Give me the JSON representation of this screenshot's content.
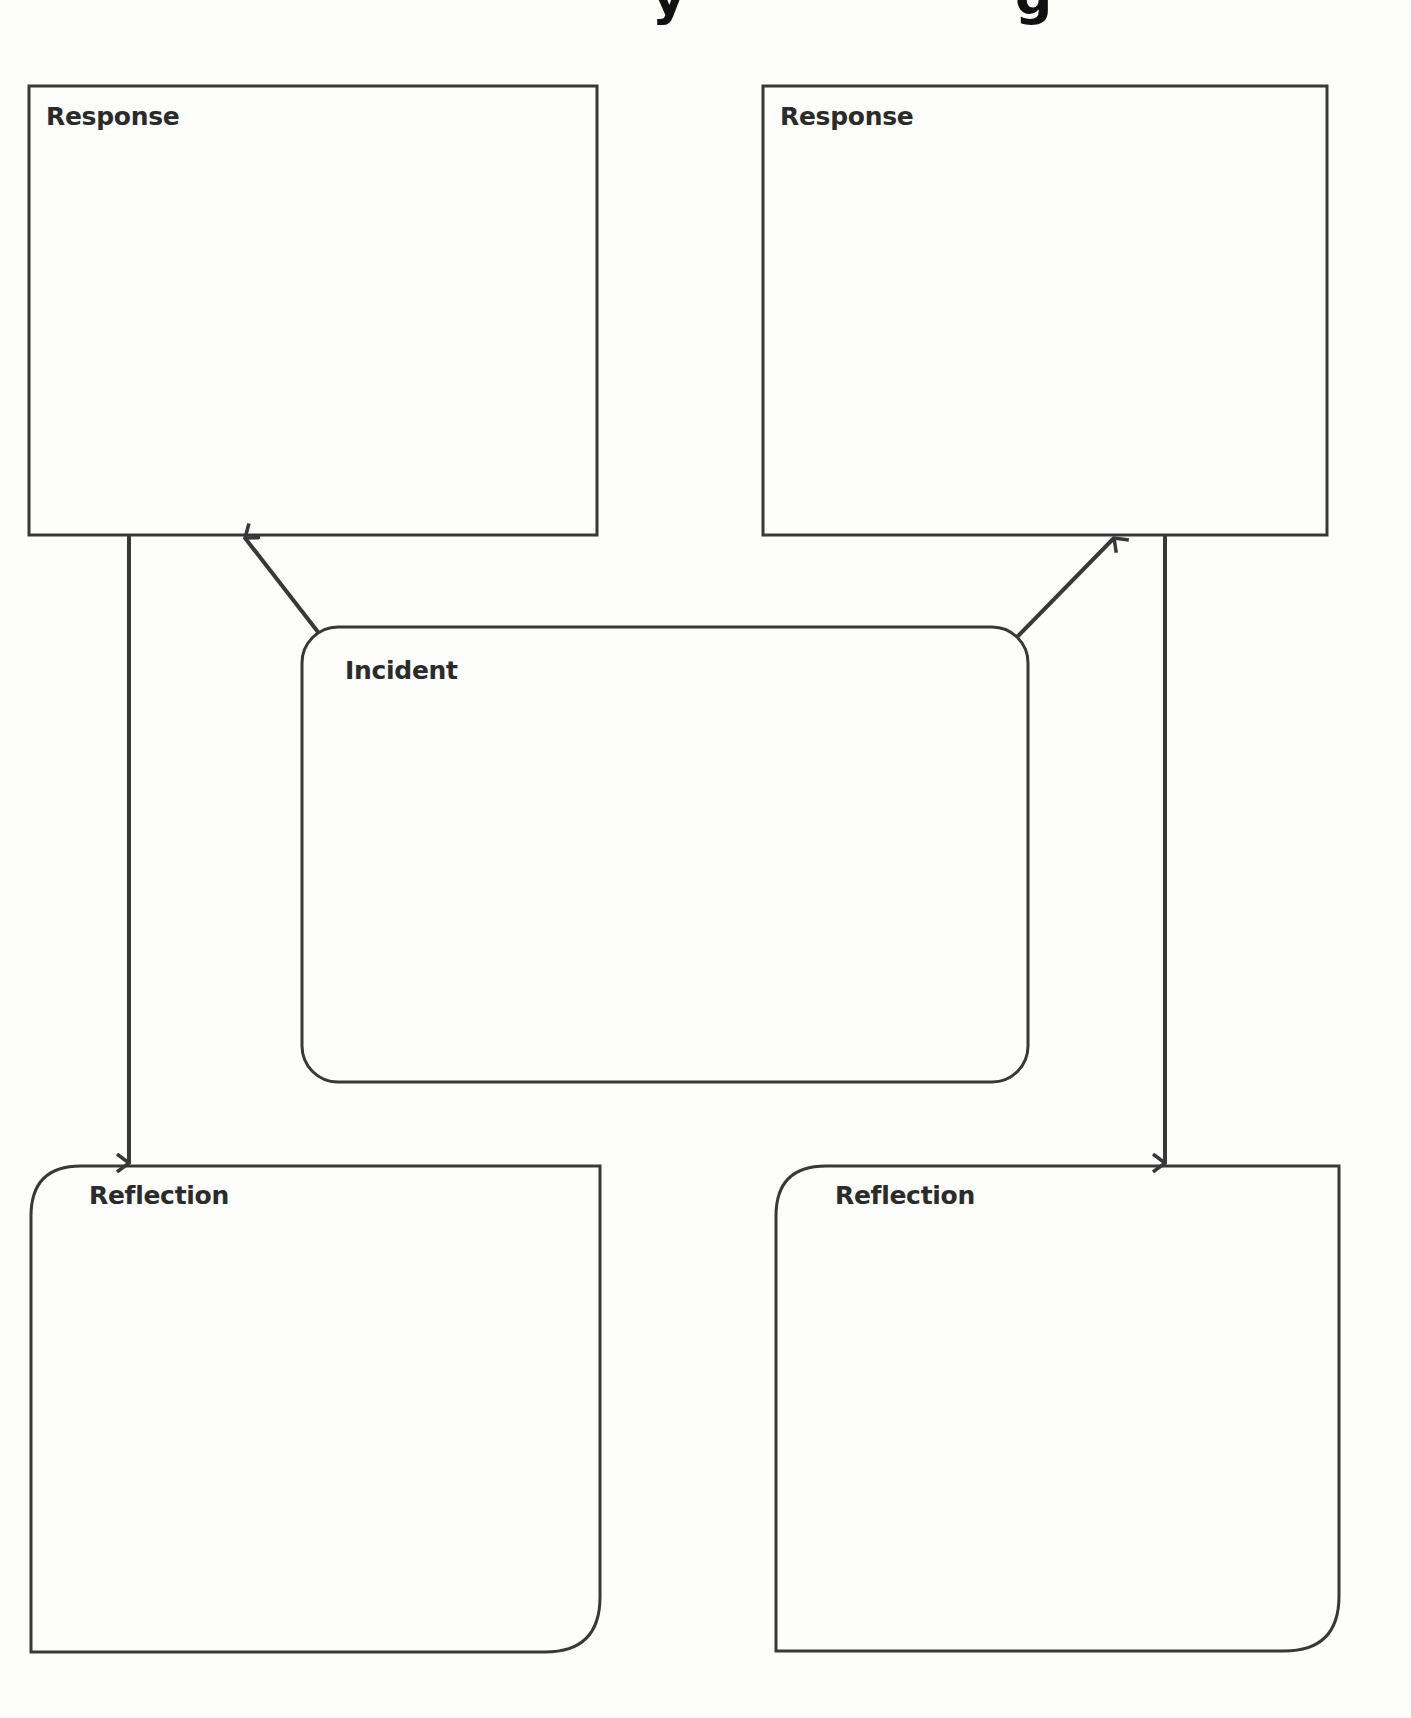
{
  "page": {
    "title_partial": "y g"
  },
  "colors": {
    "stroke": "#383838",
    "background": "#fdfdfc",
    "label": "#2b2b2b"
  },
  "boxes": {
    "response_left": {
      "label": "Response"
    },
    "response_right": {
      "label": "Response"
    },
    "incident": {
      "label": "Incident"
    },
    "reflection_left": {
      "label": "Reflection"
    },
    "reflection_right": {
      "label": "Reflection"
    }
  },
  "arrows": [
    {
      "from": "incident",
      "to": "response_left"
    },
    {
      "from": "incident",
      "to": "response_right"
    },
    {
      "from": "response_left",
      "to": "reflection_left"
    },
    {
      "from": "response_right",
      "to": "reflection_right"
    }
  ]
}
